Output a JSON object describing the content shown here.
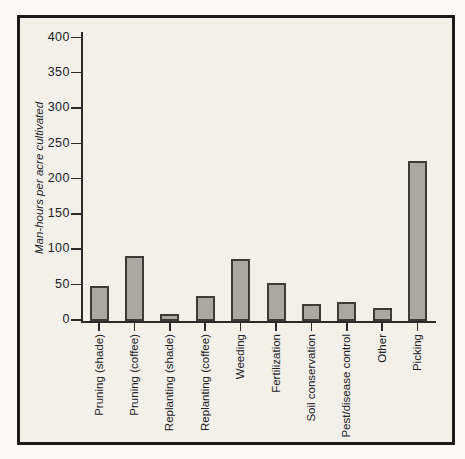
{
  "figure": {
    "page_background": "#fbfaf6",
    "frame_background": "#f2f0e9",
    "frame_border_color": "#1d1c1a"
  },
  "chart_data": {
    "type": "bar",
    "title": "",
    "xlabel": "",
    "ylabel": "Man-hours per acre cultivated",
    "categories": [
      "Pruning (shade)",
      "Pruning (coffee)",
      "Replanting (shade)",
      "Replanting (coffee)",
      "Weeding",
      "Fertilization",
      "Soil conservation",
      "Pest/disease control",
      "Other",
      "Picking"
    ],
    "values": [
      50,
      92,
      10,
      35,
      88,
      54,
      24,
      27,
      19,
      226
    ],
    "yticks": [
      0,
      50,
      100,
      150,
      200,
      250,
      300,
      350,
      400
    ],
    "ylim": [
      0,
      415
    ],
    "grid": false,
    "legend": null,
    "bar_color": "#a9a8a3",
    "bar_border_color": "#3c3b38",
    "axis_color": "#2b2a28",
    "text_color": "#22211f"
  }
}
